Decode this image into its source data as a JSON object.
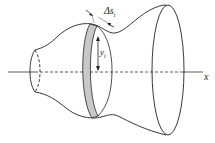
{
  "diagram": {
    "labels": {
      "delta_s": "Δs",
      "delta_s_sub": "i",
      "y": "y",
      "y_sub": "i",
      "x_axis": "x"
    },
    "colors": {
      "stroke": "#222222",
      "band_fill": "#c8c8c8",
      "background": "#ffffff"
    }
  }
}
